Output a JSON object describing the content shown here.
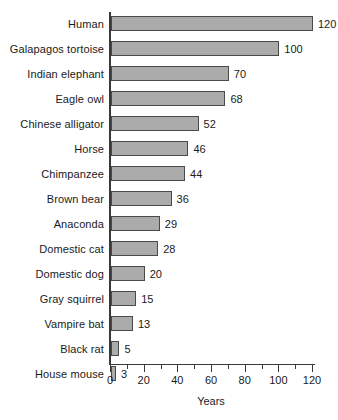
{
  "chart_data": {
    "type": "bar",
    "orientation": "horizontal",
    "title": "",
    "subtitle": "",
    "xlabel": "Years",
    "ylabel": "",
    "xlim": [
      0,
      120
    ],
    "grid": false,
    "legend": null,
    "categories": [
      "Human",
      "Galapagos tortoise",
      "Indian elephant",
      "Eagle owl",
      "Chinese alligator",
      "Horse",
      "Chimpanzee",
      "Brown bear",
      "Anaconda",
      "Domestic cat",
      "Domestic dog",
      "Gray squirrel",
      "Vampire bat",
      "Black rat",
      "House mouse"
    ],
    "values": [
      120,
      100,
      70,
      68,
      52,
      46,
      44,
      36,
      29,
      28,
      20,
      15,
      13,
      5,
      3
    ],
    "data_labels": [
      "120",
      "100",
      "70",
      "68",
      "52",
      "46",
      "44",
      "36",
      "29",
      "28",
      "20",
      "15",
      "13",
      "5",
      "3"
    ],
    "x_ticks_major": [
      0,
      20,
      40,
      60,
      80,
      100,
      120
    ],
    "x_tick_labels": [
      "0",
      "20",
      "40",
      "60",
      "80",
      "100",
      "120"
    ],
    "x_ticks_minor": [
      10,
      30,
      50,
      70,
      90,
      110
    ],
    "colors": {
      "bar_fill": "#ababab",
      "bar_border": "#4a4a4a",
      "axis": "#3a3a3a",
      "text": "#1a1a1a",
      "background": "#ffffff"
    }
  }
}
